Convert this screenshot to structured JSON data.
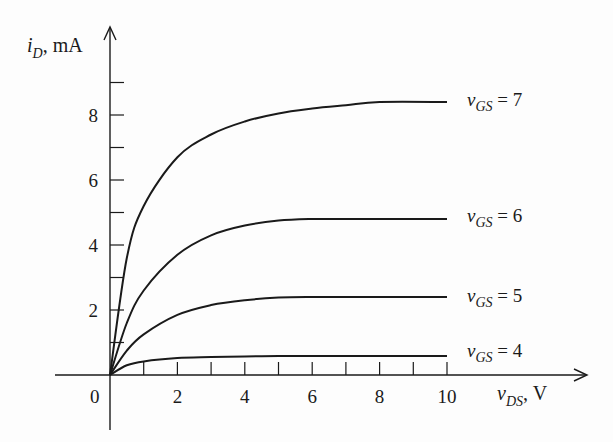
{
  "chart_data": {
    "type": "line",
    "title": "",
    "xlabel": "v_DS, V",
    "ylabel": "i_D, mA",
    "xlim": [
      0,
      10
    ],
    "ylim": [
      0,
      9
    ],
    "x_ticks_labeled": [
      0,
      2,
      4,
      6,
      8,
      10
    ],
    "x_ticks_minor": [
      1,
      3,
      5,
      7,
      9
    ],
    "y_ticks_labeled": [
      2,
      4,
      6,
      8
    ],
    "y_ticks_minor": [
      1,
      3,
      5,
      7,
      9
    ],
    "grid": false,
    "legend": "inline labels at right end of each curve",
    "series": [
      {
        "name": "v_GS = 7",
        "x": [
          0,
          0.5,
          1,
          2,
          3,
          4,
          5,
          6,
          7,
          8,
          10
        ],
        "values": [
          0,
          3.6,
          5.2,
          6.7,
          7.4,
          7.8,
          8.05,
          8.2,
          8.3,
          8.4,
          8.4
        ]
      },
      {
        "name": "v_GS = 6",
        "x": [
          0,
          0.5,
          1,
          2,
          3,
          4,
          5,
          6,
          7,
          8,
          10
        ],
        "values": [
          0,
          1.6,
          2.6,
          3.7,
          4.3,
          4.6,
          4.75,
          4.8,
          4.8,
          4.8,
          4.8
        ]
      },
      {
        "name": "v_GS = 5",
        "x": [
          0,
          0.5,
          1,
          2,
          3,
          4,
          5,
          6,
          7,
          8,
          10
        ],
        "values": [
          0,
          0.75,
          1.25,
          1.85,
          2.15,
          2.3,
          2.38,
          2.4,
          2.4,
          2.4,
          2.4
        ]
      },
      {
        "name": "v_GS = 4",
        "x": [
          0,
          0.5,
          1,
          2,
          3,
          4,
          5,
          6,
          7,
          8,
          10
        ],
        "values": [
          0,
          0.3,
          0.42,
          0.52,
          0.55,
          0.57,
          0.58,
          0.58,
          0.58,
          0.58,
          0.58
        ]
      }
    ]
  },
  "labels": {
    "y_axis_main": "i",
    "y_axis_sub": "D",
    "y_axis_unit": ", mA",
    "x_axis_main": "v",
    "x_axis_sub": "DS",
    "x_axis_unit": ", V",
    "origin": "0",
    "curve_labels": [
      {
        "main": "v",
        "sub": "GS",
        "eq": " = 7"
      },
      {
        "main": "v",
        "sub": "GS",
        "eq": " = 6"
      },
      {
        "main": "v",
        "sub": "GS",
        "eq": " = 5"
      },
      {
        "main": "v",
        "sub": "GS",
        "eq": " = 4"
      }
    ]
  },
  "colors": {
    "ink": "#1a1a1a",
    "background": "#fdfdfd"
  }
}
